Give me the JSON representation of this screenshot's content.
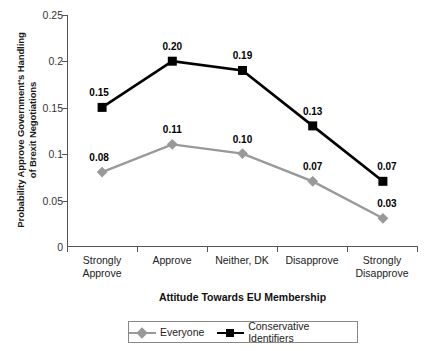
{
  "chart_data": {
    "type": "line",
    "title": "",
    "xlabel": "Attitude Towards EU Membership",
    "ylabel": "Probability Approve Government's Handling of Brexit Negotiations",
    "ylabel_line1": "Probability Approve Government's Handling",
    "ylabel_line2": "of Brexit Negotiations",
    "categories": [
      "Strongly Approve",
      "Approve",
      "Neither, DK",
      "Disapprove",
      "Strongly Disapprove"
    ],
    "category_lines": [
      [
        "Strongly",
        "Approve"
      ],
      [
        "Approve",
        ""
      ],
      [
        "Neither, DK",
        ""
      ],
      [
        "Disapprove",
        ""
      ],
      [
        "Strongly",
        "Disapprove"
      ]
    ],
    "ylim": [
      0,
      0.25
    ],
    "yticks": [
      0.25,
      0.2,
      0.15,
      0.1,
      0.05,
      0
    ],
    "ytick_labels": [
      "0.25",
      "0.2",
      "0.15",
      "0.1",
      "0.05",
      "0"
    ],
    "grid": false,
    "legend_position": "bottom",
    "series": [
      {
        "name": "Everyone",
        "color": "#999999",
        "marker": "diamond",
        "values": [
          0.08,
          0.11,
          0.1,
          0.07,
          0.03
        ],
        "labels": [
          "0.08",
          "0.11",
          "0.10",
          "0.07",
          "0.03"
        ]
      },
      {
        "name": "Conservative Identifiers",
        "color": "#000000",
        "marker": "square",
        "values": [
          0.15,
          0.2,
          0.19,
          0.13,
          0.07
        ],
        "labels": [
          "0.15",
          "0.20",
          "0.19",
          "0.13",
          "0.07"
        ]
      }
    ]
  },
  "legend": {
    "items": [
      {
        "label": "Everyone"
      },
      {
        "label": "Conservative Identifiers"
      }
    ]
  }
}
